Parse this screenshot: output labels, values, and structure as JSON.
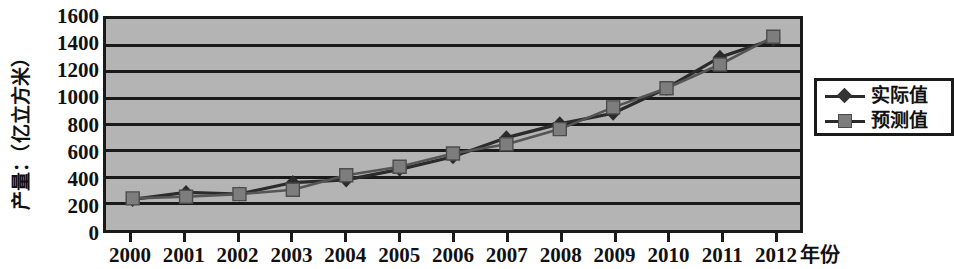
{
  "chart_data": {
    "type": "line",
    "title": "",
    "xlabel": "年份",
    "ylabel": "产量：（亿立方米）",
    "x": [
      2000,
      2001,
      2002,
      2003,
      2004,
      2005,
      2006,
      2007,
      2008,
      2009,
      2010,
      2011,
      2012
    ],
    "categories": [
      "2000",
      "2001",
      "2002",
      "2003",
      "2004",
      "2005",
      "2006",
      "2007",
      "2008",
      "2009",
      "2010",
      "2011",
      "2012"
    ],
    "series": [
      {
        "name": "实际值",
        "marker": "diamond",
        "color": "#333333",
        "values": [
          232,
          285,
          273,
          360,
          380,
          460,
          555,
          700,
          805,
          885,
          1075,
          1310,
          1445
        ]
      },
      {
        "name": "预测值",
        "marker": "square",
        "color": "#7d7d7d",
        "values": [
          240,
          252,
          272,
          305,
          415,
          480,
          580,
          650,
          765,
          930,
          1075,
          1255,
          1465
        ]
      }
    ],
    "ylim": [
      0,
      1600
    ],
    "ytick_step": 200,
    "yticks": [
      0,
      200,
      400,
      600,
      800,
      1000,
      1200,
      1400,
      1600
    ],
    "ytick_labels": [
      "0",
      "200",
      "400",
      "600",
      "800",
      "1000",
      "1200",
      "1400",
      "1600"
    ],
    "grid": true,
    "grid_axis": "y",
    "legend_position": "right",
    "plot_background": "#b4b4b4",
    "axis_color": "#1a1a1a"
  },
  "legend": {
    "items": [
      {
        "label": "实际值",
        "marker": "diamond"
      },
      {
        "label": "预测值",
        "marker": "square"
      }
    ]
  },
  "axes": {
    "y_title": "产量：（亿立方米）",
    "x_title": "年份"
  }
}
